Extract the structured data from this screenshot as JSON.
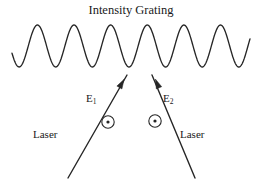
{
  "figure": {
    "title": "Intensity Grating",
    "background_color": "#ffffff",
    "stroke_color": "#262626",
    "width": 262,
    "height": 184
  },
  "labels": {
    "field_1": "E",
    "field_1_subscript": "1",
    "field_2": "E",
    "field_2_subscript": "2",
    "laser_left": "Laser",
    "laser_right": "Laser"
  },
  "icons": {
    "polarization_left": "circled-dot-icon",
    "polarization_right": "circled-dot-icon",
    "arrow_left": "arrowhead-up-right-icon",
    "arrow_right": "arrowhead-up-left-icon"
  },
  "chart_data": {
    "type": "line",
    "title": "Intensity Grating",
    "xlabel": "",
    "ylabel": "",
    "grid": false,
    "legend": null,
    "xlim": [
      12,
      250
    ],
    "ylim": [
      25,
      68
    ],
    "series": [
      {
        "name": "intensity-grating-wave",
        "description": "Sinusoidal interference fringe pattern",
        "periods": 6.5,
        "amplitude": 21,
        "baseline_y": 46,
        "x_start": 12,
        "x_end": 250,
        "phase_start_deg": 200
      }
    ],
    "beams": [
      {
        "name": "laser-beam-left",
        "from": [
          68,
          178
        ],
        "to": [
          127,
          75
        ],
        "arrow_at": [
          122,
          83
        ],
        "direction": "up-right"
      },
      {
        "name": "laser-beam-right",
        "from": [
          195,
          178
        ],
        "to": [
          152,
          75
        ],
        "arrow_at": [
          157,
          83
        ],
        "direction": "up-left"
      }
    ],
    "markers": [
      {
        "name": "polarization-symbol-left",
        "center": [
          108,
          122
        ],
        "radius": 6.2,
        "dot_radius": 1.6
      },
      {
        "name": "polarization-symbol-right",
        "center": [
          155,
          121
        ],
        "radius": 6.2,
        "dot_radius": 1.6
      }
    ]
  }
}
